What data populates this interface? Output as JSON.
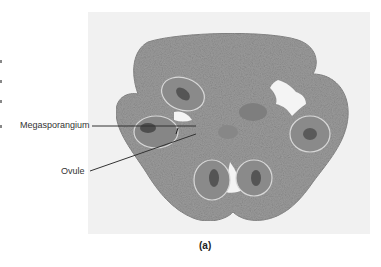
{
  "figure": {
    "panel_label": "(a)",
    "labels": [
      {
        "text": "Megasporangium"
      },
      {
        "text": "Ovule"
      }
    ],
    "colors": {
      "background": "#ffffff",
      "photo_backdrop": "#f1f1f1",
      "tissue": "#9a9a9a",
      "tissue_dark": "#5e5e5e",
      "leader_line": "#333333"
    }
  }
}
